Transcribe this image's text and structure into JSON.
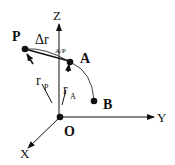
{
  "diagram": {
    "axes": {
      "x": "X",
      "y": "Y",
      "z": "Z"
    },
    "points": {
      "origin": "O",
      "p": "P",
      "a": "A",
      "b": "B"
    },
    "vectors": {
      "r_p": {
        "main": "r",
        "sub": "P"
      },
      "r_a": {
        "main": "r",
        "sub": "A"
      },
      "delta_r": {
        "main": "Δr",
        "sub": "A/P"
      }
    },
    "colors": {
      "ink": "#111111",
      "background": "#ffffff"
    }
  }
}
